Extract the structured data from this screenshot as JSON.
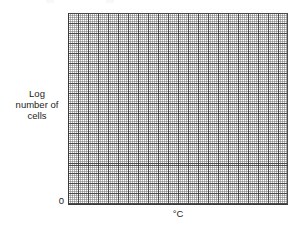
{
  "figure": {
    "type": "blank-graph-paper",
    "background_color": "#ffffff"
  },
  "axes": {
    "y_label_lines": [
      "Log",
      "number of",
      "cells"
    ],
    "x_label": "°C",
    "origin_label": "0"
  },
  "chart_data": {
    "type": "line",
    "title": "",
    "subtitle": "",
    "xlabel": "°C",
    "ylabel": "Log number of cells",
    "grid": true,
    "grid_style": "graph-paper",
    "minor_grid_spacing_px": 2,
    "major_grid_spacing_px": 10,
    "legend": null,
    "legend_position": "none",
    "xticklabels": [],
    "yticklabels": [
      "0"
    ],
    "x": [],
    "series": [],
    "values": [],
    "categories": [],
    "annotations": [],
    "note": "Empty grid supplied for the reader to plot a curve; no data is drawn.",
    "colors": {
      "grid_minor": "#787878",
      "grid_major": "#3c3c3c",
      "axis": "#3a3a3a",
      "text": "#1c1c1c",
      "background": "#ffffff"
    }
  }
}
